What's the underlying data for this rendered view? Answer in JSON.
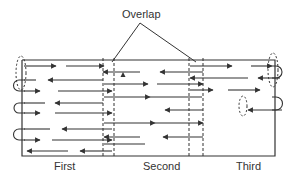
{
  "diagram": {
    "title_label": "Overlap",
    "sections": [
      {
        "label": "First"
      },
      {
        "label": "Second"
      },
      {
        "label": "Third"
      }
    ],
    "colors": {
      "stroke": "#333333",
      "background": "#ffffff"
    },
    "frame": {
      "x1": 22,
      "y1": 60,
      "x2": 275,
      "y2": 156
    },
    "overlap_zones": [
      {
        "x1": 103,
        "x2": 114
      },
      {
        "x1": 189,
        "x2": 203
      }
    ],
    "overlap_pointer": {
      "apex": [
        140,
        23
      ],
      "targets": [
        [
          112,
          62
        ],
        [
          196,
          62
        ]
      ]
    },
    "arrows": [
      {
        "x1": 24,
        "x2": 56,
        "y": 66,
        "dir": "right"
      },
      {
        "x1": 66,
        "x2": 104,
        "y": 66,
        "dir": "right"
      },
      {
        "x1": 103,
        "x2": 140,
        "y": 72,
        "dir": "left"
      },
      {
        "x1": 48,
        "x2": 103,
        "y": 80,
        "dir": "left"
      },
      {
        "x1": 24,
        "x2": 36,
        "y": 80,
        "dir": "none"
      },
      {
        "x1": 24,
        "x2": 40,
        "y": 91,
        "dir": "right"
      },
      {
        "x1": 58,
        "x2": 112,
        "y": 91,
        "dir": "right"
      },
      {
        "x1": 55,
        "x2": 103,
        "y": 103,
        "dir": "left"
      },
      {
        "x1": 24,
        "x2": 45,
        "y": 103,
        "dir": "none"
      },
      {
        "x1": 24,
        "x2": 40,
        "y": 113,
        "dir": "right"
      },
      {
        "x1": 55,
        "x2": 112,
        "y": 113,
        "dir": "right"
      },
      {
        "x1": 62,
        "x2": 112,
        "y": 129,
        "dir": "left"
      },
      {
        "x1": 24,
        "x2": 50,
        "y": 129,
        "dir": "none"
      },
      {
        "x1": 24,
        "x2": 40,
        "y": 140,
        "dir": "right"
      },
      {
        "x1": 52,
        "x2": 112,
        "y": 140,
        "dir": "right"
      },
      {
        "x1": 27,
        "x2": 68,
        "y": 151,
        "dir": "left"
      },
      {
        "x1": 80,
        "x2": 112,
        "y": 151,
        "dir": "left"
      },
      {
        "x1": 104,
        "x2": 148,
        "y": 84,
        "dir": "right"
      },
      {
        "x1": 104,
        "x2": 150,
        "y": 97,
        "dir": "right"
      },
      {
        "x1": 104,
        "x2": 155,
        "y": 123,
        "dir": "right"
      },
      {
        "x1": 104,
        "x2": 140,
        "y": 137,
        "dir": "left"
      },
      {
        "x1": 104,
        "x2": 145,
        "y": 144,
        "dir": "none"
      },
      {
        "x1": 160,
        "x2": 203,
        "y": 72,
        "dir": "left"
      },
      {
        "x1": 157,
        "x2": 203,
        "y": 84,
        "dir": "right"
      },
      {
        "x1": 150,
        "x2": 202,
        "y": 97,
        "dir": "none"
      },
      {
        "x1": 165,
        "x2": 203,
        "y": 110,
        "dir": "left"
      },
      {
        "x1": 155,
        "x2": 203,
        "y": 123,
        "dir": "right"
      },
      {
        "x1": 163,
        "x2": 203,
        "y": 137,
        "dir": "left"
      },
      {
        "x1": 190,
        "x2": 232,
        "y": 66,
        "dir": "right"
      },
      {
        "x1": 190,
        "x2": 248,
        "y": 78,
        "dir": "left"
      },
      {
        "x1": 190,
        "x2": 213,
        "y": 90,
        "dir": "right"
      },
      {
        "x1": 228,
        "x2": 260,
        "y": 90,
        "dir": "right"
      },
      {
        "x1": 251,
        "x2": 272,
        "y": 66,
        "dir": "right"
      },
      {
        "x1": 258,
        "x2": 280,
        "y": 78,
        "dir": "left"
      },
      {
        "x1": 248,
        "x2": 282,
        "y": 110,
        "dir": "left"
      }
    ],
    "markers": [
      {
        "x": 123,
        "y": 75,
        "shape": "triangle-up"
      }
    ],
    "u_turns": [
      {
        "side": "left",
        "x": 19,
        "y1": 80,
        "y2": 91
      },
      {
        "side": "left",
        "x": 19,
        "y1": 103,
        "y2": 113
      },
      {
        "side": "left",
        "x": 19,
        "y1": 129,
        "y2": 140
      },
      {
        "side": "right",
        "x": 276,
        "y1": 66,
        "y2": 78
      },
      {
        "side": "right",
        "x": 276,
        "y1": 97,
        "y2": 110
      }
    ],
    "dashed_ellipses": [
      {
        "cx": 21,
        "cy": 73,
        "rx": 5,
        "ry": 17
      },
      {
        "cx": 273,
        "cy": 70,
        "rx": 5,
        "ry": 17
      },
      {
        "cx": 243,
        "cy": 106,
        "rx": 4,
        "ry": 10
      }
    ]
  }
}
